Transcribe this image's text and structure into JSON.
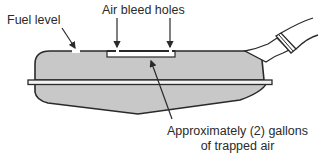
{
  "diagram": {
    "type": "fuel tank cross-section",
    "labels": {
      "fuel_level": "Fuel level",
      "air_bleed_holes": "Air bleed holes",
      "trapped_air_line1": "Approximately (2) gallons",
      "trapped_air_line2": "of trapped air"
    },
    "colors": {
      "tank_fill": "#c8c8c8",
      "outline": "#2a2a2a",
      "text": "#2a2a2a",
      "background": "#ffffff"
    }
  }
}
